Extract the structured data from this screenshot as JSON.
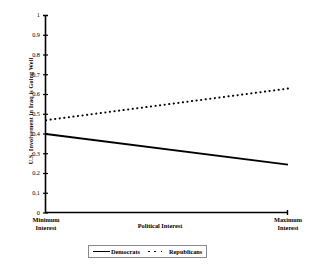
{
  "chart_data": {
    "type": "line",
    "title": "",
    "xlabel": "Political Interest",
    "ylabel": "U.S. Involvement in Iraq is Going Well",
    "xlim": [
      0,
      1
    ],
    "ylim": [
      0,
      1
    ],
    "grid": false,
    "legend_position": "bottom-center",
    "x": [
      0,
      1
    ],
    "x_tick_labels": [
      "Minimum Interest",
      "Maximum Interest"
    ],
    "x_tick_label_lines": [
      [
        "Minimum",
        "Interest"
      ],
      [
        "Maximum",
        "Interest"
      ]
    ],
    "y_tick_labels": [
      "0",
      "0.1",
      "0.2",
      "0.3",
      "0.4",
      "0.5",
      "0.6",
      "0.7",
      "0.8",
      "0.9",
      "1"
    ],
    "y_tick_values": [
      0,
      0.1,
      0.2,
      0.3,
      0.4,
      0.5,
      0.6,
      0.7,
      0.8,
      0.9,
      1
    ],
    "series": [
      {
        "name": "Democrats",
        "style": "solid",
        "color": "#000000",
        "values": [
          0.4,
          0.245
        ]
      },
      {
        "name": "Republicans",
        "style": "dotted",
        "color": "#000000",
        "values": [
          0.47,
          0.63
        ]
      }
    ],
    "legend_entries": [
      "Democrats",
      "Republicans"
    ]
  },
  "axes": {
    "y_title": "U.S. Involvement in Iraq is Going Well",
    "x_title": "Political Interest"
  },
  "ticks": {
    "y": [
      {
        "label": "1",
        "value": 1.0
      },
      {
        "label": "0.9",
        "value": 0.9
      },
      {
        "label": "0.8",
        "value": 0.8
      },
      {
        "label": "0.7",
        "value": 0.7
      },
      {
        "label": "0.6",
        "value": 0.6
      },
      {
        "label": "0.5",
        "value": 0.5
      },
      {
        "label": "0.4",
        "value": 0.4
      },
      {
        "label": "0.3",
        "value": 0.3
      },
      {
        "label": "0.2",
        "value": 0.2
      },
      {
        "label": "0.1",
        "value": 0.1
      },
      {
        "label": "0",
        "value": 0.0
      }
    ],
    "x_left_line1": "Minimum",
    "x_left_line2": "Interest",
    "x_right_line1": "Maximum",
    "x_right_line2": "Interest"
  },
  "legend": {
    "democrats_label": "Democrats",
    "republicans_label": "Republicans"
  }
}
